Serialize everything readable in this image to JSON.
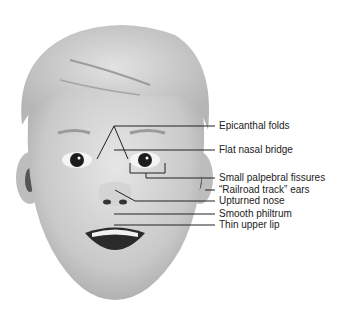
{
  "figure": {
    "type": "labeled illustration",
    "line_color": "#222222"
  },
  "labels": [
    {
      "text": "Epicanthal folds",
      "y": 120
    },
    {
      "text": "Flat nasal bridge",
      "y": 144
    },
    {
      "text": "Small palpebral fissures",
      "y": 172
    },
    {
      "text": "“Railroad track” ears",
      "y": 184
    },
    {
      "text": "Upturned nose",
      "y": 195
    },
    {
      "text": "Smooth philtrum",
      "y": 208
    },
    {
      "text": "Thin upper lip",
      "y": 219
    }
  ]
}
